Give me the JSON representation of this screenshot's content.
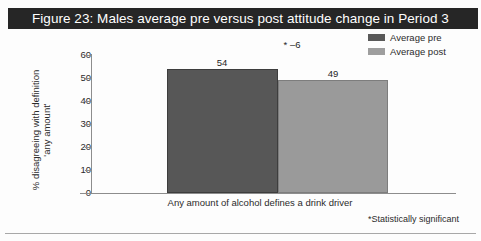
{
  "figure": {
    "title": "Figure 23: Males average pre versus post attitude change in Period 3",
    "title_bar_color": "#262626",
    "footnote": "*Statistically significant",
    "top_bleed_text": ""
  },
  "legend": {
    "items": [
      {
        "label": "Average pre",
        "color": "#595959"
      },
      {
        "label": "Average post",
        "color": "#9e9e9e"
      }
    ]
  },
  "axis": {
    "y_title_line1": "% disagreeing with definition",
    "y_title_line2": "'any amount'",
    "y_ticks": [
      "60",
      "50",
      "40",
      "30",
      "20",
      "10",
      "0"
    ]
  },
  "annotations": {
    "delta": "*  –6"
  },
  "chart_data": {
    "type": "bar",
    "title": "Figure 23: Males average pre versus post attitude change in Period 3",
    "categories": [
      "Any amount of alcohol defines a drink driver"
    ],
    "series": [
      {
        "name": "Average pre",
        "values": [
          54
        ],
        "color": "#575757"
      },
      {
        "name": "Average post",
        "values": [
          49
        ],
        "color": "#9a9a9a"
      }
    ],
    "value_labels": [
      "54",
      "49"
    ],
    "xlabel": "",
    "ylabel": "% disagreeing with definition 'any amount'",
    "ylim": [
      0,
      60
    ],
    "ytick_step": 10,
    "yticks": [
      0,
      10,
      20,
      30,
      40,
      50,
      60
    ],
    "grid": false,
    "legend_position": "top-right",
    "annotations": [
      {
        "text": "* –6",
        "meaning": "change of minus 6, statistically significant"
      }
    ],
    "footnote": "*Statistically significant"
  }
}
